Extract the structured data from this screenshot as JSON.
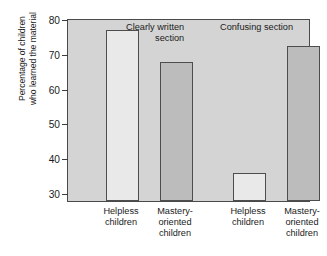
{
  "chart_data": {
    "type": "bar",
    "title": "",
    "xlabel": "",
    "ylabel": "Percentage of children who learned the material",
    "ylabel_lines": [
      "Percentage of children",
      "who learned the material"
    ],
    "ylim": [
      28,
      80
    ],
    "yticks": [
      30,
      40,
      50,
      60,
      70,
      80
    ],
    "ytick_labels": [
      "30",
      "40",
      "50",
      "60",
      "70",
      "80"
    ],
    "grid": false,
    "legend": null,
    "categories": [
      "Helpless children",
      "Mastery-oriented children",
      "Helpless children",
      "Mastery-oriented children"
    ],
    "category_lines": [
      [
        "Helpless",
        "children"
      ],
      [
        "Mastery-",
        "oriented",
        "children"
      ],
      [
        "Helpless",
        "children"
      ],
      [
        "Mastery-",
        "oriented",
        "children"
      ]
    ],
    "values": [
      77,
      68,
      36,
      72.5
    ],
    "bar_fills": [
      "light",
      "dark",
      "light",
      "dark"
    ],
    "annotations": [
      {
        "text": "Clearly written section",
        "lines": [
          "Clearly written",
          "section"
        ]
      },
      {
        "text": "Confusing section",
        "lines": [
          "Confusing section"
        ]
      }
    ],
    "colors": {
      "plot_background": "#d4d4d4",
      "bar_light": "#e9e9e9",
      "bar_dark": "#bcbcbc",
      "axis": "#4a4a4a",
      "text": "#1b1b1b"
    }
  }
}
